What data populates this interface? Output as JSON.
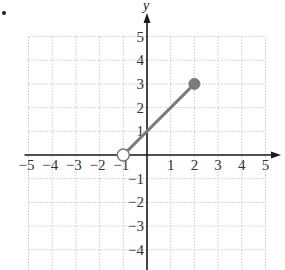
{
  "chart_data": {
    "type": "line",
    "title": "",
    "xlabel": "",
    "ylabel": "y",
    "xlim": [
      -5,
      5
    ],
    "ylim": [
      -5,
      5
    ],
    "grid": true,
    "x_ticks": [
      "-5",
      "-4",
      "-3",
      "-2",
      "-1",
      "1",
      "2",
      "3",
      "4",
      "5"
    ],
    "y_ticks": [
      "5",
      "4",
      "3",
      "2",
      "1",
      "-1",
      "-2",
      "-3",
      "-4"
    ],
    "series": [
      {
        "name": "segment",
        "x": [
          -1,
          2
        ],
        "y": [
          0,
          3
        ],
        "color": "#7a7a7a",
        "start_point": {
          "x": -1,
          "y": 0,
          "style": "open"
        },
        "end_point": {
          "x": 2,
          "y": 3,
          "style": "closed"
        }
      }
    ]
  },
  "colors": {
    "axis": "#1a1a1a",
    "grid": "#c8c8c8",
    "line": "#7a7a7a",
    "point": "#7a7a7a"
  }
}
